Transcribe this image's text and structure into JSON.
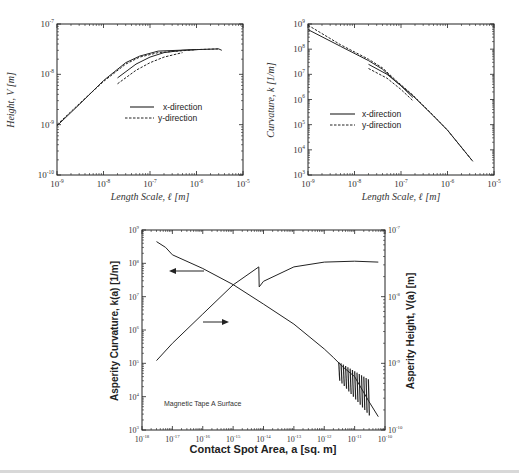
{
  "chart_data": [
    {
      "id": "height",
      "type": "line",
      "title": "",
      "xlabel": "Length Scale, ℓ [m]",
      "ylabel": "Height, V [m]",
      "xscale": "log",
      "yscale": "log",
      "xlim": [
        1e-09,
        1e-05
      ],
      "ylim": [
        1e-10,
        1e-07
      ],
      "xticks": [
        "10-9",
        "10-8",
        "10-7",
        "10-6",
        "10-5"
      ],
      "yticks": [
        "10-10",
        "10-9",
        "10-8",
        "10-7"
      ],
      "legend": [
        "x-direction",
        "y-direction"
      ],
      "legend_position": "center-right",
      "series": [
        {
          "name": "x-direction",
          "style": "solid",
          "x": [
            1e-09,
            3e-09,
            1e-08,
            3e-08,
            6e-08,
            1.5e-07,
            4e-07,
            1e-06,
            3e-06,
            3.5e-06
          ],
          "y": [
            9.5e-10,
            2.5e-09,
            7.5e-09,
            1.7e-08,
            2.3e-08,
            2.9e-08,
            3e-08,
            3.1e-08,
            3.2e-08,
            3e-08
          ]
        },
        {
          "name": "x-direction (subset)",
          "style": "solid",
          "x": [
            2e-08,
            5e-08,
            1e-07,
            2e-07,
            5e-07,
            1e-06
          ],
          "y": [
            8.5e-09,
            1.6e-08,
            2.2e-08,
            2.7e-08,
            3e-08,
            3.1e-08
          ]
        },
        {
          "name": "y-direction",
          "style": "dashed",
          "x": [
            1e-09,
            3e-09,
            1e-08,
            3e-08,
            6e-08,
            1.5e-07,
            4e-07,
            1e-06,
            3e-06
          ],
          "y": [
            1e-09,
            2.6e-09,
            7.2e-09,
            1.6e-08,
            2.2e-08,
            2.7e-08,
            2.9e-08,
            3.1e-08,
            3.2e-08
          ]
        },
        {
          "name": "y-direction (subset)",
          "style": "dashed",
          "x": [
            2e-08,
            5e-08,
            1e-07,
            2e-07,
            5e-07
          ],
          "y": [
            6.5e-09,
            1.2e-08,
            1.7e-08,
            2.2e-08,
            2.7e-08
          ]
        }
      ]
    },
    {
      "id": "curvature",
      "type": "line",
      "title": "",
      "xlabel": "Length Scale, ℓ [m]",
      "ylabel": "Curvature, k [1/m]",
      "xscale": "log",
      "yscale": "log",
      "xlim": [
        1e-09,
        1e-05
      ],
      "ylim": [
        1000.0,
        1000000000.0
      ],
      "xticks": [
        "10-9",
        "10-8",
        "10-7",
        "10-6",
        "10-5"
      ],
      "yticks": [
        "10^3",
        "10^4",
        "10^5",
        "10^6",
        "10^7",
        "10^8",
        "10^9"
      ],
      "legend": [
        "x-direction",
        "y-direction"
      ],
      "legend_position": "center-left",
      "series": [
        {
          "name": "x-direction",
          "style": "solid",
          "x": [
            1e-09,
            5e-09,
            2e-08,
            4e-08,
            8e-08,
            1.8e-07,
            5e-07,
            1e-06,
            3.5e-06
          ],
          "y": [
            600000000.0,
            130000000.0,
            35000000.0,
            16000000.0,
            5000000.0,
            1400000.0,
            220000.0,
            60000.0,
            3500.0
          ]
        },
        {
          "name": "x-direction (subset)",
          "style": "solid",
          "x": [
            2e-08,
            5e-08,
            1e-07,
            1.8e-07
          ],
          "y": [
            25000000.0,
            10000000.0,
            3500000.0,
            1200000.0
          ]
        },
        {
          "name": "y-direction",
          "style": "dashed",
          "x": [
            1e-09,
            5e-09,
            2e-08,
            4e-08,
            8e-08,
            1.8e-07,
            5e-07,
            1e-06,
            3.5e-06
          ],
          "y": [
            900000000.0,
            150000000.0,
            40000000.0,
            18000000.0,
            5500000.0,
            1500000.0,
            230000.0,
            60000.0,
            3500.0
          ]
        },
        {
          "name": "y-direction (subset)",
          "style": "dashed",
          "x": [
            2e-08,
            5e-08,
            1e-07,
            1.8e-07
          ],
          "y": [
            17000000.0,
            7000000.0,
            2500000.0,
            900000.0
          ]
        }
      ]
    },
    {
      "id": "asperity",
      "type": "line",
      "title": "",
      "annotation": "Magnetic Tape A Surface",
      "xlabel": "Contact Spot Area, a [sq. m]",
      "ylabel": "Asperity Curvature, k(a)  [1/m]",
      "ylabel_right": "Asperity Height, V(a)  [m]",
      "xscale": "log",
      "yscale": "log",
      "xlim": [
        1e-18,
        1e-10
      ],
      "ylim": [
        1000.0,
        1000000000.0
      ],
      "ylim_right": [
        1e-10,
        1e-07
      ],
      "xticks": [
        "10-18",
        "10-17",
        "10-16",
        "10-15",
        "10-14",
        "10-13",
        "10-12",
        "10-11",
        "10-10"
      ],
      "yticks": [
        "10^3",
        "10^4",
        "10^5",
        "10^6",
        "10^7",
        "10^8",
        "10^9"
      ],
      "yticks_right": [
        "10-10",
        "10-9",
        "10-8",
        "10-7"
      ],
      "series": [
        {
          "name": "Asperity Curvature k(a)",
          "axis": "left",
          "style": "solid",
          "x": [
            3e-18,
            6e-18,
            1e-17,
            1e-16,
            1e-15,
            1e-14,
            1e-13,
            1e-12,
            2e-12,
            4e-12,
            1e-11,
            3e-11,
            6e-11
          ],
          "y": [
            450000000.0,
            300000000.0,
            180000000.0,
            70000000.0,
            23000000.0,
            6000000.0,
            1500000.0,
            270000.0,
            150000.0,
            80000.0,
            40000.0,
            7000.0,
            2500.0
          ]
        },
        {
          "name": "Asperity Height V(a)",
          "axis": "right",
          "style": "solid",
          "x": [
            3e-18,
            1e-17,
            1e-16,
            1e-15,
            7e-15,
            7.2e-15,
            1e-14,
            1e-13,
            1e-12,
            1e-11,
            6e-11
          ],
          "y": [
            1.1e-09,
            2e-09,
            5.5e-09,
            1.5e-08,
            2.8e-08,
            1.4e-08,
            1.7e-08,
            2.8e-08,
            3.3e-08,
            3.4e-08,
            3.3e-08
          ]
        }
      ]
    }
  ],
  "labels": {
    "tl_ylabel": "Height, V [m]",
    "tl_xlabel": "Length Scale, ℓ [m]",
    "tr_ylabel": "Curvature, k [1/m]",
    "tr_xlabel": "Length Scale, ℓ [m]",
    "legend_x": "x-direction",
    "legend_y": "y-direction",
    "b_xlabel": "Contact Spot Area, a [sq. m]",
    "b_ylabel_left": "Asperity Curvature, k(a)  [1/m]",
    "b_ylabel_right": "Asperity Height, V(a)  [m]",
    "b_annotation": "Magnetic Tape A Surface"
  }
}
